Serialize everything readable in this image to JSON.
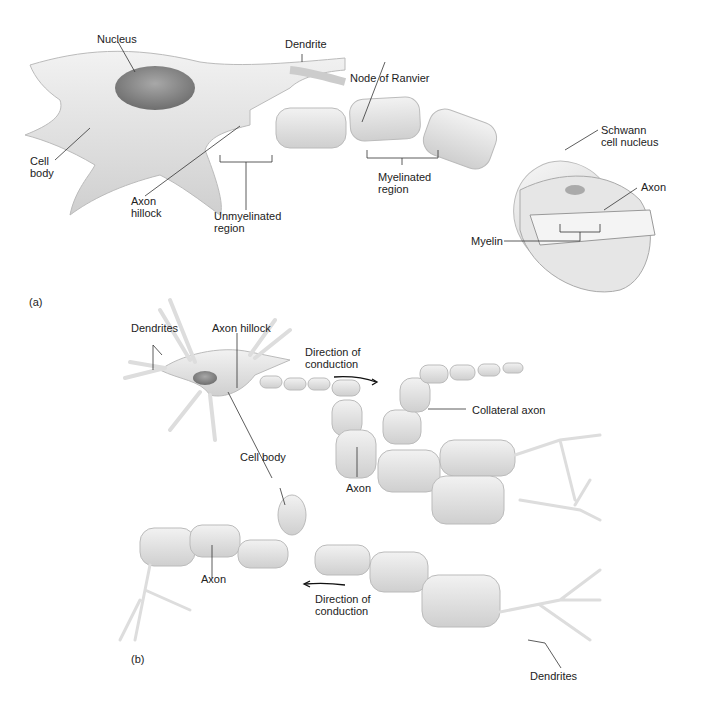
{
  "panel_a": {
    "tag": "(a)",
    "labels": {
      "nucleus": "Nucleus",
      "dendrite": "Dendrite",
      "node_of_ranvier": "Node of Ranvier",
      "cell_body": "Cell\nbody",
      "axon_hillock": "Axon\nhillock",
      "unmyelinated_region": "Unmyelinated\nregion",
      "myelinated_region": "Myelinated\nregion",
      "schwann_cell_nucleus": "Schwann\ncell nucleus",
      "axon": "Axon",
      "myelin": "Myelin"
    }
  },
  "panel_b": {
    "tag": "(b)",
    "labels": {
      "dendrites_top": "Dendrites",
      "axon_hillock": "Axon hillock",
      "direction_top": "Direction of\nconduction",
      "collateral_axon": "Collateral axon",
      "cell_body": "Cell body",
      "axon_mid": "Axon",
      "axon_bottom": "Axon",
      "direction_bottom": "Direction of\nconduction",
      "dendrites_bottom": "Dendrites"
    }
  },
  "colors": {
    "fill": "#e8e8e8",
    "shade": "#cfcfcf",
    "nucleus": "#8a8a8a",
    "line": "#333333"
  }
}
